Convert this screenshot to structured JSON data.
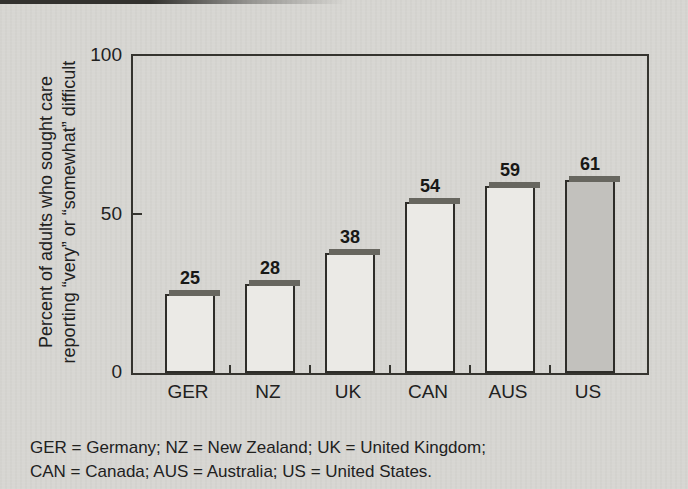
{
  "page": {
    "background_color": "#d7d6d2"
  },
  "chart_data": {
    "type": "bar",
    "categories": [
      "GER",
      "NZ",
      "UK",
      "CAN",
      "AUS",
      "US"
    ],
    "values": [
      25,
      28,
      38,
      54,
      59,
      61
    ],
    "title": "",
    "xlabel": "",
    "ylabel_line1": "Percent of adults who sought care",
    "ylabel_line2": "reporting “very” or “somewhat” difficult",
    "yticks": [
      "100",
      "50",
      "0"
    ],
    "ylim": [
      0,
      100
    ],
    "grid": "off",
    "legend": "none",
    "bar_fill": "#ebeae6",
    "highlight_bar_fill": "#c2c1bd",
    "highlighted_category": "US",
    "bar_border_color": "#2e2d29",
    "cap_color": "#67665f"
  },
  "footnote": {
    "line1": "GER = Germany; NZ = New Zealand; UK = United Kingdom;",
    "line2": "CAN = Canada; AUS = Australia; US = United States."
  }
}
